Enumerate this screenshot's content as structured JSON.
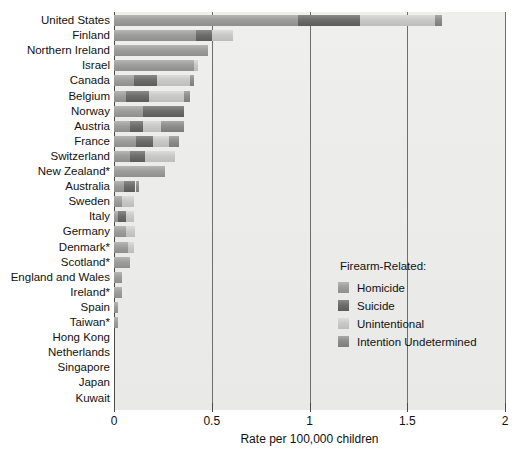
{
  "chart_data": {
    "type": "bar",
    "orientation": "horizontal",
    "stacked": true,
    "title": "",
    "xlabel": "Rate per 100,000 children",
    "ylabel": "",
    "xlim": [
      0,
      2
    ],
    "xticks": [
      0,
      0.5,
      1,
      1.5,
      2
    ],
    "xtick_labels": [
      "0",
      "0.5",
      "1",
      "1.5",
      "2"
    ],
    "grid": "vertical",
    "legend_position": "inside-right",
    "legend_title": "Firearm-Related:",
    "categories": [
      "United States",
      "Finland",
      "Northern Ireland",
      "Israel",
      "Canada",
      "Belgium",
      "Norway",
      "Austria",
      "France",
      "Switzerland",
      "New Zealand*",
      "Australia",
      "Sweden",
      "Italy",
      "Germany",
      "Denmark*",
      "Scotland*",
      "England and Wales",
      "Ireland*",
      "Spain",
      "Taiwan*",
      "Hong Kong",
      "Netherlands",
      "Singapore",
      "Japan",
      "Kuwait"
    ],
    "series": [
      {
        "name": "Homicide",
        "color": "#9e9e9c",
        "values": [
          0.94,
          0.42,
          0.48,
          0.41,
          0.1,
          0.06,
          0.15,
          0.08,
          0.11,
          0.08,
          0.26,
          0.05,
          0.04,
          0.02,
          0.06,
          0.07,
          0.08,
          0.04,
          0.04,
          0.02,
          0.02,
          0.0,
          0.0,
          0.0,
          0.0,
          0.0
        ]
      },
      {
        "name": "Suicide",
        "color": "#6d6d6b",
        "values": [
          0.32,
          0.08,
          0.0,
          0.0,
          0.12,
          0.12,
          0.21,
          0.07,
          0.09,
          0.08,
          0.0,
          0.06,
          0.0,
          0.04,
          0.0,
          0.0,
          0.0,
          0.0,
          0.0,
          0.0,
          0.0,
          0.0,
          0.0,
          0.0,
          0.0,
          0.0
        ]
      },
      {
        "name": "Unintentional",
        "color": "#c9c9c7",
        "values": [
          0.38,
          0.11,
          0.0,
          0.02,
          0.17,
          0.18,
          0.0,
          0.09,
          0.08,
          0.15,
          0.0,
          0.0,
          0.06,
          0.04,
          0.05,
          0.03,
          0.0,
          0.0,
          0.0,
          0.0,
          0.0,
          0.0,
          0.0,
          0.0,
          0.0,
          0.0
        ]
      },
      {
        "name": "Intention Undetermined",
        "color": "#8d8d8b",
        "values": [
          0.04,
          0.0,
          0.0,
          0.0,
          0.02,
          0.03,
          0.0,
          0.12,
          0.05,
          0.0,
          0.0,
          0.02,
          0.0,
          0.0,
          0.0,
          0.0,
          0.0,
          0.0,
          0.0,
          0.0,
          0.0,
          0.0,
          0.0,
          0.0,
          0.0,
          0.0
        ]
      }
    ],
    "totals": [
      1.68,
      0.61,
      0.48,
      0.43,
      0.41,
      0.39,
      0.36,
      0.36,
      0.33,
      0.31,
      0.26,
      0.13,
      0.1,
      0.1,
      0.11,
      0.1,
      0.08,
      0.04,
      0.04,
      0.02,
      0.02,
      0.0,
      0.0,
      0.0,
      0.0,
      0.0
    ],
    "footnote_marker": "*"
  },
  "legend": {
    "title": "Firearm-Related:",
    "items": [
      {
        "label": "Homicide",
        "key": "homicide"
      },
      {
        "label": "Suicide",
        "key": "suicide"
      },
      {
        "label": "Unintentional",
        "key": "unintentional"
      },
      {
        "label": "Intention Undetermined",
        "key": "undetermined"
      }
    ]
  },
  "axis": {
    "title": "Rate per 100,000 children",
    "tick_labels": [
      "0",
      "0.5",
      "1",
      "1.5",
      "2"
    ]
  },
  "colors": {
    "plot_background": "#ececeb",
    "gridline": "#6e6e6e",
    "text": "#111111",
    "homicide": "#9e9e9c",
    "suicide": "#6d6d6b",
    "unintentional": "#c9c9c7",
    "undetermined": "#8d8d8b"
  }
}
